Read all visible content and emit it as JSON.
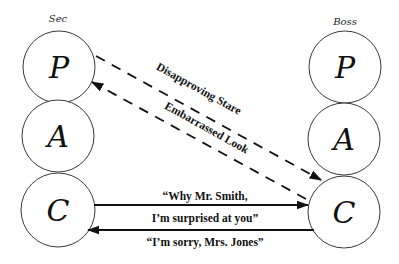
{
  "parties": {
    "left": {
      "label": "Sec",
      "states": [
        {
          "id": "parent",
          "letter": "P"
        },
        {
          "id": "adult",
          "letter": "A"
        },
        {
          "id": "child",
          "letter": "C"
        }
      ]
    },
    "right": {
      "label": "Boss",
      "states": [
        {
          "id": "parent",
          "letter": "P"
        },
        {
          "id": "adult",
          "letter": "A"
        },
        {
          "id": "child",
          "letter": "C"
        }
      ]
    }
  },
  "transactions": {
    "disapproving": {
      "label": "Disapproving Stare",
      "from": "Sec P",
      "to": "Boss C",
      "style": "dashed"
    },
    "embarrassed": {
      "label": "Embarrassed Look",
      "from": "Boss C",
      "to": "Sec P",
      "style": "dashed"
    },
    "why_line1": "“Why Mr. Smith,",
    "why_line2": "I’m surprised at you”",
    "why": {
      "from": "Sec C",
      "to": "Boss C",
      "style": "solid"
    },
    "sorry": {
      "label": "“I’m sorry, Mrs. Jones”",
      "from": "Boss C",
      "to": "Sec C",
      "style": "solid"
    }
  },
  "colors": {
    "line": "#111111",
    "circle": "#3a3a3a",
    "background": "#ffffff"
  }
}
